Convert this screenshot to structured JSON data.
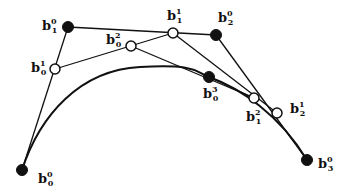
{
  "diagram": {
    "title": "",
    "type": "de Casteljau subdivision of a cubic Bezier curve",
    "colors": {
      "stroke": "#111111",
      "background": "#ffffff"
    },
    "curve": {
      "control_points": [
        "b0_0",
        "b1_0",
        "b2_0",
        "b3_0"
      ]
    },
    "points": [
      {
        "id": "b0_0",
        "base": "b",
        "sub": "0",
        "sup": "0",
        "x": 22,
        "y": 170,
        "filled": true,
        "lx": 38,
        "ly": 183
      },
      {
        "id": "b1_0",
        "base": "b",
        "sub": "1",
        "sup": "0",
        "x": 68,
        "y": 27,
        "filled": true,
        "lx": 42,
        "ly": 30
      },
      {
        "id": "b2_0",
        "base": "b",
        "sub": "2",
        "sup": "0",
        "x": 216,
        "y": 35,
        "filled": true,
        "lx": 218,
        "ly": 22
      },
      {
        "id": "b3_0",
        "base": "b",
        "sub": "3",
        "sup": "0",
        "x": 307,
        "y": 160,
        "filled": true,
        "lx": 318,
        "ly": 168
      },
      {
        "id": "b0_1",
        "base": "b",
        "sub": "0",
        "sup": "1",
        "x": 55,
        "y": 69,
        "filled": false,
        "lx": 31,
        "ly": 72
      },
      {
        "id": "b1_1",
        "base": "b",
        "sub": "1",
        "sup": "1",
        "x": 173,
        "y": 33,
        "filled": false,
        "lx": 167,
        "ly": 20
      },
      {
        "id": "b2_1",
        "base": "b",
        "sub": "2",
        "sup": "1",
        "x": 277,
        "y": 113,
        "filled": false,
        "lx": 290,
        "ly": 113
      },
      {
        "id": "b0_2",
        "base": "b",
        "sub": "0",
        "sup": "2",
        "x": 131,
        "y": 46,
        "filled": false,
        "lx": 106,
        "ly": 44
      },
      {
        "id": "b1_2",
        "base": "b",
        "sub": "1",
        "sup": "2",
        "x": 254,
        "y": 98,
        "filled": false,
        "lx": 246,
        "ly": 121
      },
      {
        "id": "b0_3",
        "base": "b",
        "sub": "0",
        "sup": "3",
        "x": 209,
        "y": 77,
        "filled": true,
        "lx": 203,
        "ly": 98
      }
    ],
    "segments": [
      [
        "b0_0",
        "b1_0"
      ],
      [
        "b1_0",
        "b2_0"
      ],
      [
        "b2_0",
        "b3_0"
      ],
      [
        "b0_1",
        "b1_1"
      ],
      [
        "b1_1",
        "b2_1"
      ],
      [
        "b0_2",
        "b1_2"
      ],
      [
        "b0_3",
        "b1_2"
      ]
    ]
  }
}
